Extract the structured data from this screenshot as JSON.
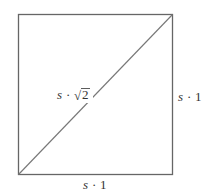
{
  "diagram": {
    "type": "square-with-diagonal",
    "colors": {
      "line": "#666666",
      "text": "#333333",
      "background": "#ffffff"
    },
    "labels": {
      "diagonal": {
        "var": "s",
        "dot": "·",
        "sqrt_symbol": "√",
        "radicand": "2"
      },
      "right_side": {
        "var": "s",
        "dot": "·",
        "value": "1"
      },
      "bottom_side": {
        "var": "s",
        "dot": "·",
        "value": "1"
      }
    }
  }
}
